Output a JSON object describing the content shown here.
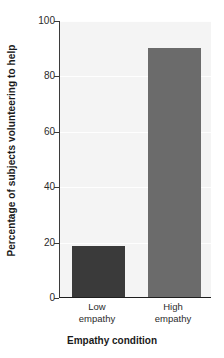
{
  "chart_data": {
    "type": "bar",
    "title": "",
    "subtitle": "",
    "xlabel": "Empathy condition",
    "ylabel": "Percentage of subjects volunteering to help",
    "categories": [
      "Low empathy",
      "High empathy"
    ],
    "category_lines": [
      [
        "Low",
        "empathy"
      ],
      [
        "High",
        "empathy"
      ]
    ],
    "values": [
      18.5,
      90
    ],
    "ylim": [
      0,
      100
    ],
    "y_ticks": [
      0,
      20,
      40,
      60,
      80,
      100
    ],
    "y_tick_labels": [
      "0",
      "20",
      "40",
      "60",
      "80",
      "100"
    ],
    "grid": true,
    "legend": "none",
    "bar_colors": [
      "#3a3a3a",
      "#6b6b6b"
    ],
    "plot_background": "#f4f4f4",
    "axis_color": "#1e1e1e",
    "page_background": "#ffffff"
  }
}
